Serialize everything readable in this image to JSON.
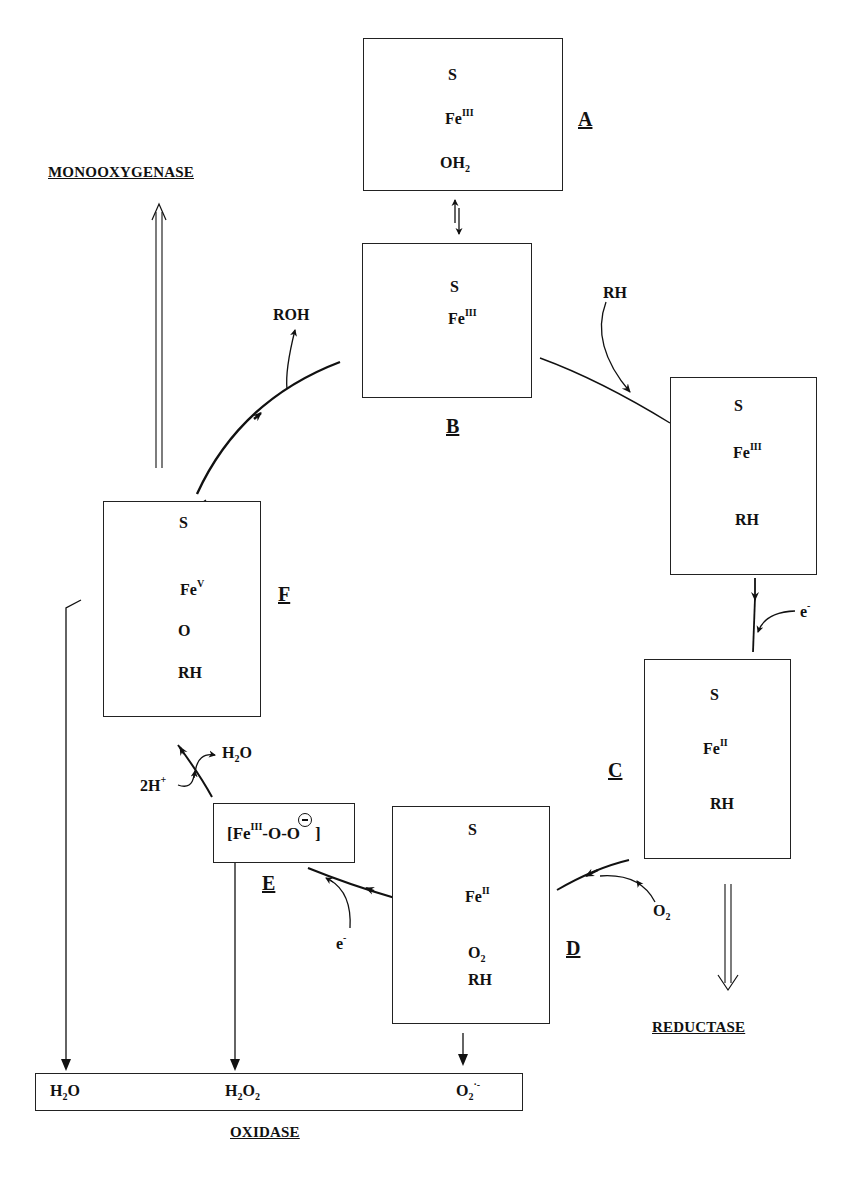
{
  "diagram": {
    "pathways": {
      "monooxygenase": "MONOOXYGENASE",
      "reductase": "REDUCTASE",
      "oxidase": "OXIDASE"
    },
    "states": [
      {
        "id": "A",
        "label": "A",
        "axial_top": "S",
        "iron": "Fe",
        "oxidation": "III",
        "axial_bottom": "OH",
        "axial_bottom_sub": "2",
        "substrate": ""
      },
      {
        "id": "B",
        "label": "B",
        "axial_top": "S",
        "iron": "Fe",
        "oxidation": "III",
        "substrate": ""
      },
      {
        "id": "B2",
        "label": "",
        "axial_top": "S",
        "iron": "Fe",
        "oxidation": "III",
        "substrate": "RH"
      },
      {
        "id": "C",
        "label": "C",
        "axial_top": "S",
        "iron": "Fe",
        "oxidation": "II",
        "substrate": "RH"
      },
      {
        "id": "D",
        "label": "D",
        "axial_top": "S",
        "iron": "Fe",
        "oxidation": "II",
        "axial_bottom": "O",
        "axial_bottom_sub": "2",
        "substrate": "RH"
      },
      {
        "id": "E",
        "label": "E",
        "formula_prefix": "[Fe",
        "oxidation": "III",
        "formula_suffix": "-O-O",
        "formula_close": "]"
      },
      {
        "id": "F",
        "label": "F",
        "axial_top": "S",
        "iron": "Fe",
        "oxidation": "V",
        "axial_bottom": "O",
        "substrate": "RH"
      }
    ],
    "reagents": {
      "substrate_in": "RH",
      "product_out": "ROH",
      "electron_1": "e",
      "electron_1_sup": "-",
      "electron_2": "e",
      "electron_2_sup": "-",
      "oxygen_in": "O",
      "oxygen_in_sub": "2",
      "protons": "2H",
      "protons_sup": "+",
      "water_out": "H",
      "water_out_sub": "2",
      "water_out_tail": "O"
    },
    "oxidase_products": [
      {
        "main": "H",
        "sub": "2",
        "tail": "O",
        "sub2": "",
        "sup": ""
      },
      {
        "main": "H",
        "sub": "2",
        "tail": "O",
        "sub2": "2",
        "sup": ""
      },
      {
        "main": "O",
        "sub": "2",
        "tail": "",
        "sub2": "",
        "sup": "·-"
      }
    ]
  }
}
